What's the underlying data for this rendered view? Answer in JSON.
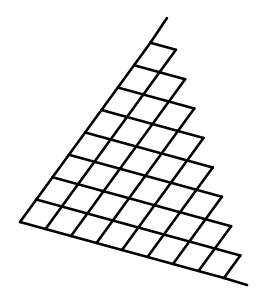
{
  "diagram": {
    "type": "staircase-lattice",
    "rows": 8,
    "row_cell_counts": [
      8,
      7,
      6,
      5,
      4,
      3,
      2,
      1
    ],
    "origin": [
      20,
      222
    ],
    "vector_along_bottom": [
      25.5,
      7.0
    ],
    "vector_along_left": [
      16.3,
      -22.4
    ],
    "left_edge_extension_to": [
      167,
      18
    ],
    "bottom_edge_extension_to": [
      247,
      285
    ],
    "stroke_color": "#000000",
    "stroke_width": 2.6,
    "background": "#ffffff"
  }
}
